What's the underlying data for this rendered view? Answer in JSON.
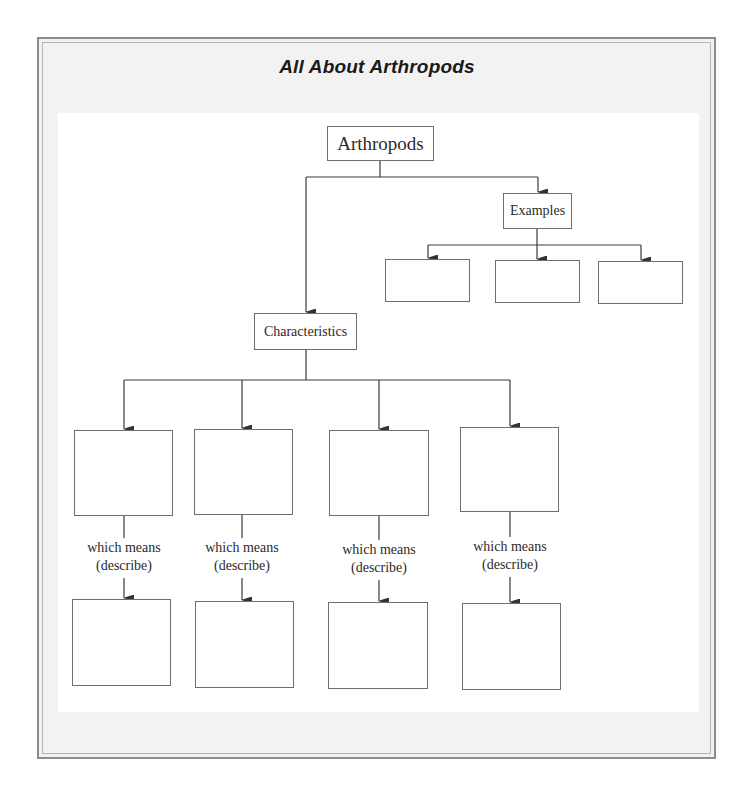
{
  "title": "All About Arthropods",
  "diagram": {
    "root": {
      "label": "Arthropods"
    },
    "examples": {
      "label": "Examples",
      "boxes": [
        "",
        "",
        ""
      ]
    },
    "characteristics": {
      "label": "Characteristics",
      "columns": [
        {
          "characteristic": "",
          "connector_line1": "which means",
          "connector_line2": "(describe)",
          "description": ""
        },
        {
          "characteristic": "",
          "connector_line1": "which means",
          "connector_line2": "(describe)",
          "description": ""
        },
        {
          "characteristic": "",
          "connector_line1": "which means",
          "connector_line2": "(describe)",
          "description": ""
        },
        {
          "characteristic": "",
          "connector_line1": "which means",
          "connector_line2": "(describe)",
          "description": ""
        }
      ]
    }
  },
  "colors": {
    "frame_border": "#8c8c8c",
    "frame_fill": "#f2f2f2",
    "line": "#333333",
    "box_border": "#6e6e6e"
  }
}
